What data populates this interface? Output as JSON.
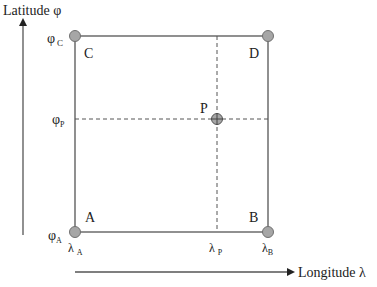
{
  "diagram": {
    "axes": {
      "y_label": "Latitude φ",
      "x_label": "Longitude λ"
    },
    "corners": {
      "A": {
        "label": "A",
        "phi": "φ",
        "phi_sub": "A",
        "lambda": "λ",
        "lambda_sub": "A"
      },
      "B": {
        "label": "B",
        "lambda": "λ",
        "lambda_sub": "B"
      },
      "C": {
        "label": "C",
        "phi": "φ",
        "phi_sub": "C"
      },
      "D": {
        "label": "D"
      }
    },
    "point": {
      "label": "P",
      "phi": "φ",
      "phi_sub": "P",
      "lambda": "λ",
      "lambda_sub": "P"
    },
    "colors": {
      "line": "#555555",
      "node_fill": "#a6a6a6",
      "node_stroke": "#707070",
      "text": "#222222"
    }
  }
}
